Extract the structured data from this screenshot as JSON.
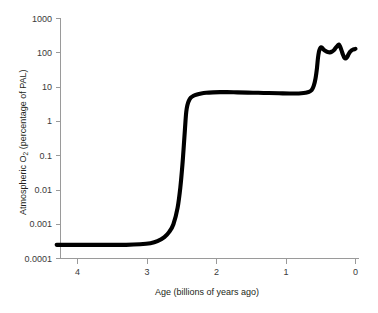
{
  "figure": {
    "background_color": "#ffffff",
    "curve_color": "#000000",
    "axis_color": "#9a9a9a",
    "text_color": "#231f20"
  },
  "axes": {
    "y": {
      "title_main": "Atmospheric O",
      "title_sub": "2",
      "title_rest": " (percentage of PAL)",
      "title_full": "Atmospheric O2 (percentage of PAL)",
      "tick_labels": [
        "1000",
        "100",
        "10",
        "1",
        "0.1",
        "0.01",
        "0.001",
        "0.0001"
      ],
      "tick_values": [
        1000,
        100,
        10,
        1,
        0.1,
        0.01,
        0.001,
        0.0001
      ],
      "scale": "log"
    },
    "x": {
      "title": "Age (billions of years ago)",
      "tick_labels": [
        "4",
        "3",
        "2",
        "1",
        "0"
      ],
      "tick_values": [
        4,
        3,
        2,
        1,
        0
      ],
      "scale": "linear",
      "direction": "reversed"
    }
  },
  "chart_data": {
    "type": "line",
    "title": "",
    "subtitle": "",
    "xlabel": "Age (billions of years ago)",
    "ylabel": "Atmospheric O2 (percentage of PAL)",
    "xscale": "linear",
    "yscale": "log",
    "x_reversed": true,
    "xlim": [
      4.3,
      -0.05
    ],
    "ylim": [
      0.0001,
      1000
    ],
    "grid": false,
    "legend": null,
    "xtick_labels": [
      "4",
      "3",
      "2",
      "1",
      "0"
    ],
    "xticks": [
      4,
      3,
      2,
      1,
      0
    ],
    "yticks": [
      0.0001,
      0.001,
      0.01,
      0.1,
      1,
      10,
      100,
      1000
    ],
    "ytick_labels": [
      "0.0001",
      "0.001",
      "0.01",
      "0.1",
      "1",
      "10",
      "100",
      "1000"
    ],
    "series": [
      {
        "name": "Atmospheric oxygen",
        "x": [
          4.3,
          4.1,
          3.9,
          3.7,
          3.5,
          3.3,
          3.1,
          2.95,
          2.85,
          2.75,
          2.68,
          2.62,
          2.56,
          2.52,
          2.49,
          2.47,
          2.455,
          2.445,
          2.435,
          2.42,
          2.4,
          2.37,
          2.33,
          2.28,
          2.22,
          2.15,
          2.05,
          1.95,
          1.85,
          1.7,
          1.55,
          1.4,
          1.25,
          1.1,
          0.95,
          0.85,
          0.78,
          0.72,
          0.67,
          0.63,
          0.6,
          0.575,
          0.555,
          0.54,
          0.525,
          0.51,
          0.495,
          0.48,
          0.46,
          0.43,
          0.4,
          0.37,
          0.34,
          0.31,
          0.285,
          0.26,
          0.24,
          0.22,
          0.2,
          0.18,
          0.16,
          0.14,
          0.12,
          0.1,
          0.08,
          0.06,
          0.04,
          0.02,
          0.0
        ],
        "y": [
          0.00025,
          0.00025,
          0.00025,
          0.00025,
          0.00025,
          0.00025,
          0.00026,
          0.00028,
          0.00032,
          0.00042,
          0.0006,
          0.001,
          0.003,
          0.012,
          0.055,
          0.2,
          0.55,
          1.1,
          1.9,
          2.9,
          3.9,
          4.9,
          5.6,
          6.1,
          6.5,
          6.8,
          7.0,
          7.1,
          7.1,
          7.0,
          6.9,
          6.8,
          6.7,
          6.6,
          6.5,
          6.5,
          6.6,
          6.8,
          7.2,
          8.2,
          11.0,
          18.0,
          35.0,
          70.0,
          110.0,
          135.0,
          145.0,
          140.0,
          125.0,
          112.0,
          105.0,
          103.0,
          108.0,
          120.0,
          140.0,
          160.0,
          175.0,
          150.0,
          115.0,
          88.0,
          72.0,
          68.0,
          75.0,
          90.0,
          105.0,
          115.0,
          122.0,
          127.0,
          130.0
        ],
        "color": "#000000",
        "line_width": 4.1
      }
    ],
    "annotations": []
  }
}
